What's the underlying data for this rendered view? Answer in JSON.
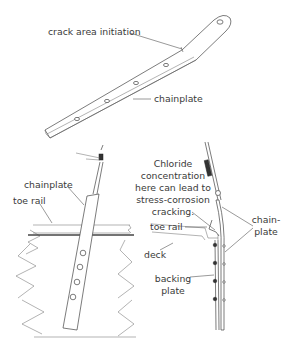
{
  "figure": {
    "top": {
      "labels": {
        "crack": "crack area initiation",
        "chainplate": "chainplate"
      }
    },
    "bottom_left": {
      "labels": {
        "chainplate": "chainplate",
        "toe_rail": "toe rail"
      }
    },
    "bottom_right": {
      "note_lines": [
        "Chloride",
        "concentration",
        "here can lead to",
        "stress-corrosion",
        "cracking."
      ],
      "labels": {
        "toe_rail": "toe rail",
        "deck": "deck",
        "backing_plate_1": "backing",
        "backing_plate_2": "plate",
        "chainplate_1": "chain-",
        "chainplate_2": "plate"
      }
    }
  }
}
